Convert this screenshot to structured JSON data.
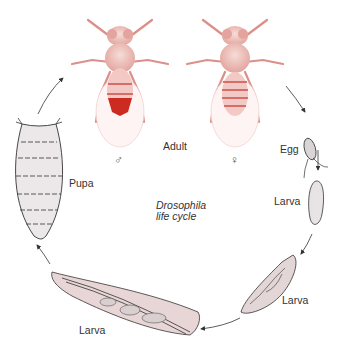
{
  "diagram": {
    "title_line1": "Drosophila",
    "title_line2": "life cycle",
    "stages": [
      {
        "id": "adult",
        "label": "Adult"
      },
      {
        "id": "egg",
        "label": "Egg"
      },
      {
        "id": "larva1",
        "label": "Larva"
      },
      {
        "id": "larva2",
        "label": "Larva"
      },
      {
        "id": "larva3",
        "label": "Larva"
      },
      {
        "id": "pupa",
        "label": "Pupa"
      }
    ],
    "sex_symbols": {
      "male": "♂",
      "female": "♀"
    },
    "colors": {
      "fly_body": "#e9b3ad",
      "fly_dark": "#c9524a",
      "male_abdomen": "#cc2b22",
      "larva_fill": "#e8d6d6",
      "pupa_fill": "#ece8ea",
      "outline": "#333333",
      "arrow": "#333333"
    }
  }
}
